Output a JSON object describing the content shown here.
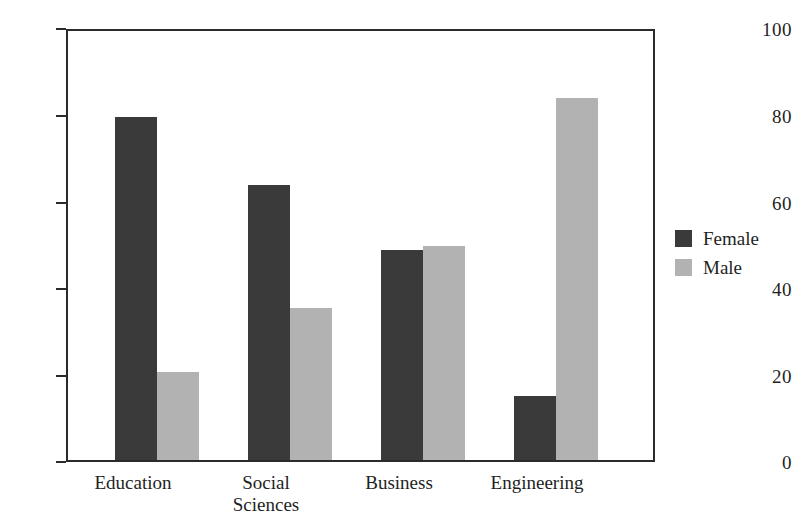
{
  "chart_data": {
    "type": "bar",
    "title": "",
    "subtitle": "",
    "xlabel": "",
    "ylabel": "",
    "categories": [
      "Education",
      "Social\nSciences",
      "Business",
      "Engineering"
    ],
    "series": [
      {
        "name": "Female",
        "color": "#3a3a3a",
        "values": [
          80,
          64,
          49,
          15
        ]
      },
      {
        "name": "Male",
        "color": "#b2b2b2",
        "values": [
          20.5,
          35.5,
          50,
          84.5
        ]
      }
    ],
    "ylim": [
      0,
      100
    ],
    "yticks": [
      0,
      20,
      40,
      60,
      80,
      100
    ],
    "ytick_labels": [
      "0",
      "20",
      "40",
      "60",
      "80",
      "100"
    ],
    "grid": false,
    "legend_position": "right",
    "background": "#ffffff",
    "axis_color": "#2b2b2b"
  },
  "legend": {
    "entries": [
      {
        "label": "Female",
        "swatch": "#3a3a3a"
      },
      {
        "label": "Male",
        "swatch": "#b2b2b2"
      }
    ]
  }
}
